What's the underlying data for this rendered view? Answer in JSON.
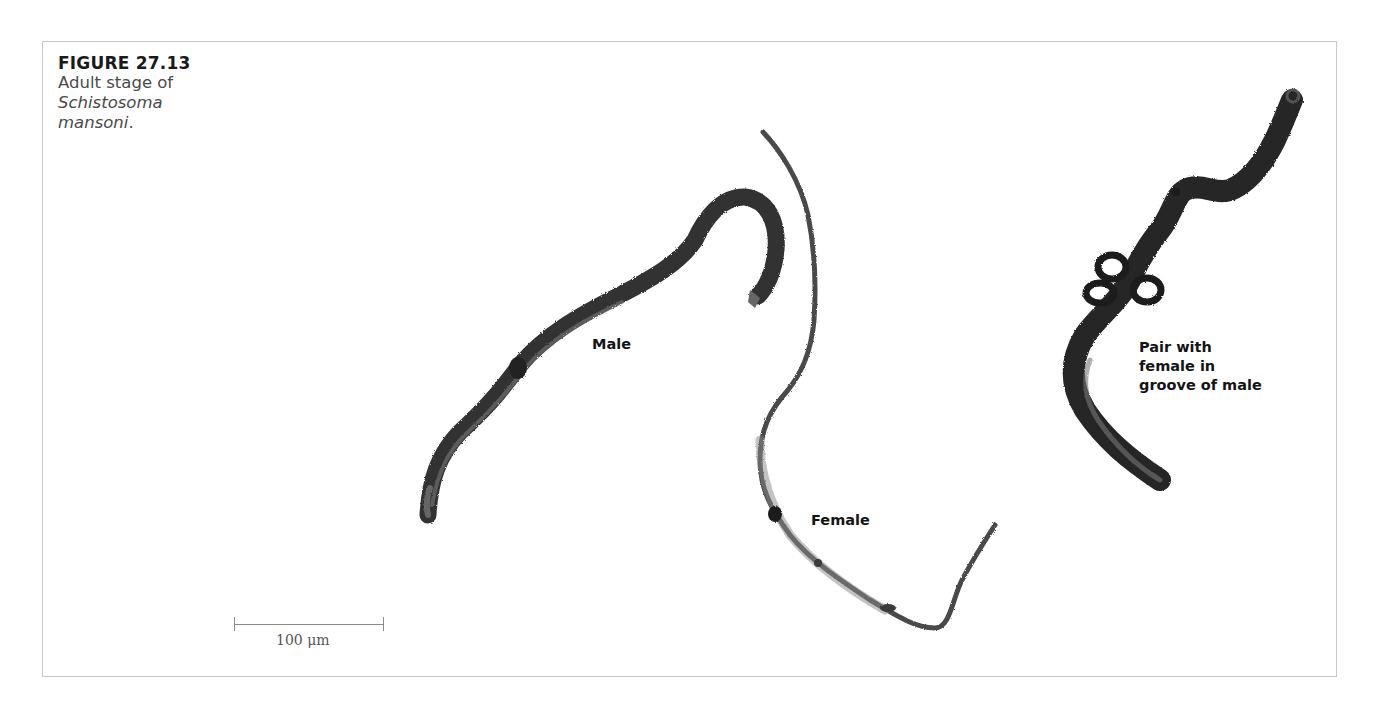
{
  "figure": {
    "label": "FIGURE 27.13",
    "caption_plain": "Adult stage of",
    "caption_italic_1": "Schistosoma",
    "caption_italic_2": "mansoni",
    "caption_end": "."
  },
  "specimens": {
    "male": {
      "label": "Male"
    },
    "female": {
      "label": "Female"
    },
    "pair": {
      "label_line1": "Pair with",
      "label_line2": "female in",
      "label_line3": "groove of male"
    }
  },
  "scale_bar": {
    "label": "100 μm",
    "value": 100,
    "unit": "μm"
  },
  "colors": {
    "worm_dark": "#2a2a2a",
    "worm_mid": "#5a5a5a",
    "frame": "#c8c8c8"
  }
}
